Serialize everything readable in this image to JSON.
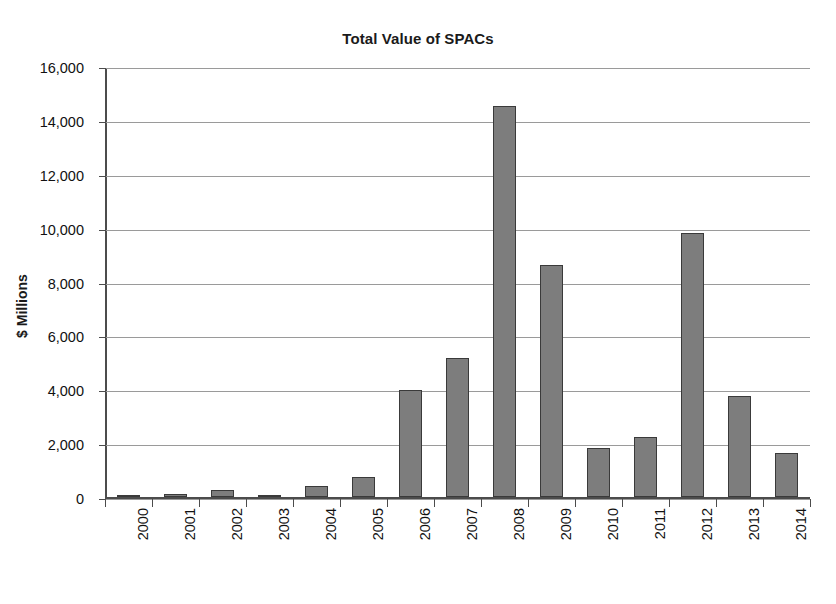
{
  "chart_data": {
    "type": "bar",
    "title": "Total Value of SPACs",
    "xlabel": "",
    "ylabel": "$ Millions",
    "categories": [
      "2000",
      "2001",
      "2002",
      "2003",
      "2004",
      "2005",
      "2006",
      "2007",
      "2008",
      "2009",
      "2010",
      "2011",
      "2012",
      "2013",
      "2014"
    ],
    "values": [
      60,
      110,
      260,
      90,
      400,
      760,
      3960,
      5150,
      14520,
      8600,
      1810,
      2220,
      9800,
      3740,
      1630
    ],
    "ylim": [
      0,
      16000
    ],
    "ytick_labels": [
      "0",
      "2,000",
      "4,000",
      "6,000",
      "8,000",
      "10,000",
      "12,000",
      "14,000",
      "16,000"
    ],
    "ytick_values": [
      0,
      2000,
      4000,
      6000,
      8000,
      10000,
      12000,
      14000,
      16000
    ],
    "grid": true,
    "legend": false,
    "legend_position": "none",
    "series_color": "#7d7d7d",
    "axis_color": "#4c4c4c",
    "grid_color": "#9a9a9a",
    "xlabel_rotation": -90
  }
}
